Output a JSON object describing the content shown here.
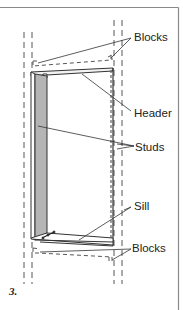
{
  "figure": {
    "number": "3.",
    "labels": {
      "blocks_top": "Blocks",
      "header": "Header",
      "studs": "Studs",
      "sill": "Sill",
      "blocks_bottom": "Blocks"
    },
    "colors": {
      "line": "#333333",
      "dashed": "#444444",
      "stud_shade": "#b5b5b5",
      "border": "#8a8a8a",
      "background": "#ffffff"
    }
  }
}
